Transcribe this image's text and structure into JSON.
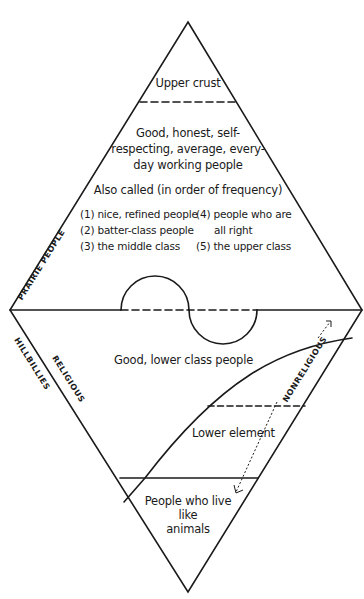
{
  "diagram": {
    "top_section": {
      "top_label": "Upper crust",
      "middle_label_lines": [
        "Good, honest, self-",
        "respecting, average, every-",
        "day working people"
      ],
      "also_called_heading": "Also called (in order of frequency)",
      "also_called_left": [
        "(1) nice, refined people",
        "(2) batter-class people",
        "(3) the middle class"
      ],
      "also_called_right": [
        "(4) people who are",
        "all right",
        "(5) the upper class"
      ]
    },
    "bottom_section": {
      "good_lower": "Good, lower class people",
      "lower_element": "Lower element",
      "animals_lines": [
        "People who live",
        "like",
        "animals"
      ]
    },
    "side_labels": {
      "prairie": "PRAIRIE PEOPLE",
      "hillbillies": "HILLBILLIES",
      "religious": "RELIGIOUS",
      "nonreligious": "NONRELIGIOUS"
    },
    "colors": {
      "ink": "#1a1a1a",
      "background": "#ffffff"
    }
  }
}
